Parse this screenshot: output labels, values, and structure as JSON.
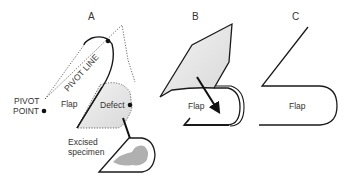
{
  "panels": {
    "a": {
      "label": "A",
      "pivot_line": "PIVOT LINE",
      "pivot_point_line1": "PIVOT",
      "pivot_point_line2": "POINT",
      "flap": "Flap",
      "defect": "Defect",
      "excised_line1": "Excised",
      "excised_line2": "specimen"
    },
    "b": {
      "label": "B",
      "flap": "Flap"
    },
    "c": {
      "label": "C",
      "flap": "Flap"
    }
  },
  "colors": {
    "stroke": "#1a1a1a",
    "fill_light": "#e6e6e6",
    "specimen": "#b0b0b0"
  }
}
